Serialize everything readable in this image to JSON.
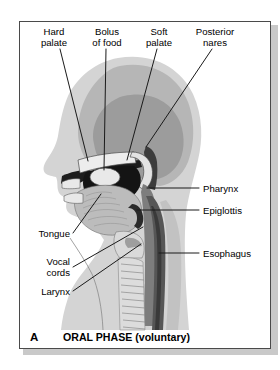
{
  "figure": {
    "panel_letter": "A",
    "caption": "ORAL PHASE (voluntary)",
    "colors": {
      "panel_border": "#4a4a4a",
      "panel_background": "#ffffff",
      "shadow": "#c9c9c9",
      "skin_light": "#d2d2d2",
      "skull_mid": "#b4b4b4",
      "brain_dark": "#9a9a9a",
      "cavity_black": "#1a1a1a",
      "tongue_gray": "#b9b9b9",
      "bolus_light": "#e6e6e6",
      "esophagus_dark": "#595959",
      "pharynx_gray": "#7d7d7d",
      "leader_line": "#1a1a1a",
      "text": "#000000"
    }
  },
  "labels": {
    "top": [
      {
        "id": "hard-palate",
        "text": "Hard\npalate",
        "x": 28,
        "y": 26,
        "width": 52,
        "align": "center"
      },
      {
        "id": "bolus-of-food",
        "text": "Bolus\nof food",
        "x": 80,
        "y": 26,
        "width": 54,
        "align": "center"
      },
      {
        "id": "soft-palate",
        "text": "Soft\npalate",
        "x": 135,
        "y": 26,
        "width": 48,
        "align": "center"
      },
      {
        "id": "posterior-nares",
        "text": "Posterior\nnares",
        "x": 184,
        "y": 26,
        "width": 62,
        "align": "center"
      }
    ],
    "right": [
      {
        "id": "pharynx",
        "text": "Pharynx",
        "x": 203,
        "y": 183,
        "width": 58,
        "align": "left"
      },
      {
        "id": "epiglottis",
        "text": "Epiglottis",
        "x": 203,
        "y": 205,
        "width": 58,
        "align": "left"
      },
      {
        "id": "esophagus",
        "text": "Esophagus",
        "x": 203,
        "y": 248,
        "width": 66,
        "align": "left"
      }
    ],
    "left": [
      {
        "id": "tongue",
        "text": "Tongue",
        "x": 22,
        "y": 234,
        "width": 48,
        "align": "right"
      },
      {
        "id": "vocal-cords",
        "text": "Vocal\ncords",
        "x": 22,
        "y": 260,
        "width": 48,
        "align": "right"
      },
      {
        "id": "larynx",
        "text": "Larynx",
        "x": 22,
        "y": 288,
        "width": 48,
        "align": "right"
      }
    ]
  },
  "leader_lines": [
    {
      "id": "leader-hard-palate",
      "x1": 60,
      "y1": 49,
      "x2": 88,
      "y2": 161
    },
    {
      "id": "leader-bolus-of-food",
      "x1": 106,
      "y1": 49,
      "x2": 104,
      "y2": 172
    },
    {
      "id": "leader-soft-palate",
      "x1": 157,
      "y1": 49,
      "x2": 125,
      "y2": 161
    },
    {
      "id": "leader-posterior-nares",
      "x1": 212,
      "y1": 49,
      "x2": 146,
      "y2": 147
    },
    {
      "id": "leader-pharynx",
      "x1": 199,
      "y1": 188,
      "x2": 147,
      "y2": 188
    },
    {
      "id": "leader-epiglottis",
      "x1": 199,
      "y1": 210,
      "x2": 136,
      "y2": 210
    },
    {
      "id": "leader-esophagus",
      "x1": 199,
      "y1": 253,
      "x2": 159,
      "y2": 253
    },
    {
      "id": "leader-tongue",
      "x1": 73,
      "y1": 234,
      "x2": 100,
      "y2": 194
    },
    {
      "id": "leader-vocal-cords",
      "x1": 73,
      "y1": 268,
      "x2": 143,
      "y2": 228
    },
    {
      "id": "leader-larynx",
      "x1": 73,
      "y1": 292,
      "x2": 141,
      "y2": 245
    }
  ],
  "anatomy_parts": [
    {
      "id": "head-skin",
      "name": "head-profile"
    },
    {
      "id": "skull",
      "name": "skull-region"
    },
    {
      "id": "brain",
      "name": "brain-region"
    },
    {
      "id": "nasal-cavity",
      "name": "nasal-cavity"
    },
    {
      "id": "hard-palate-part",
      "name": "hard-palate"
    },
    {
      "id": "soft-palate-part",
      "name": "soft-palate"
    },
    {
      "id": "bolus",
      "name": "bolus-of-food"
    },
    {
      "id": "tongue-part",
      "name": "tongue"
    },
    {
      "id": "oral-cavity",
      "name": "oral-cavity"
    },
    {
      "id": "pharynx-part",
      "name": "pharynx"
    },
    {
      "id": "epiglottis-part",
      "name": "epiglottis"
    },
    {
      "id": "larynx-part",
      "name": "larynx"
    },
    {
      "id": "vocal-cords-part",
      "name": "vocal-cords"
    },
    {
      "id": "trachea",
      "name": "trachea"
    },
    {
      "id": "esophagus-part",
      "name": "esophagus"
    },
    {
      "id": "vertebrae",
      "name": "vertebral-column"
    }
  ]
}
